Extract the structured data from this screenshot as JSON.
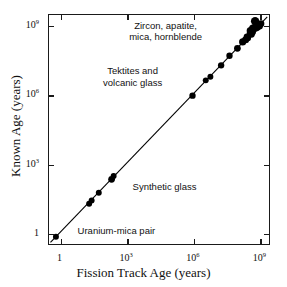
{
  "figure": {
    "background_color": "#ffffff",
    "foreground_color": "#111111"
  },
  "axes": {
    "x_title": "Fission Track Age (years)",
    "y_title": "Known Age (years)",
    "x_ticks": [
      {
        "label_mantissa": "1",
        "label_exponent": "",
        "value": 1
      },
      {
        "label_mantissa": "10",
        "label_exponent": "3",
        "value": 1000
      },
      {
        "label_mantissa": "10",
        "label_exponent": "6",
        "value": 1000000
      },
      {
        "label_mantissa": "10",
        "label_exponent": "9",
        "value": 1000000000
      }
    ],
    "y_ticks": [
      {
        "label_mantissa": "1",
        "label_exponent": "",
        "value": 1
      },
      {
        "label_mantissa": "10",
        "label_exponent": "3",
        "value": 1000
      },
      {
        "label_mantissa": "10",
        "label_exponent": "6",
        "value": 1000000
      },
      {
        "label_mantissa": "10",
        "label_exponent": "9",
        "value": 1000000000
      }
    ]
  },
  "annotations": [
    {
      "name": "zircon-apatite-label",
      "text": "Zircon, apatite,\nmica, hornblende",
      "x_pct": 53.0,
      "y_pct": 2.0,
      "align": "center"
    },
    {
      "name": "tektites-label",
      "text": "Tektites and\nvolcanic glass",
      "x_pct": 38.0,
      "y_pct": 22.0,
      "align": "center"
    },
    {
      "name": "synthetic-glass-label",
      "text": "Synthetic glass",
      "x_pct": 38.0,
      "y_pct": 72.5,
      "align": "left"
    },
    {
      "name": "uranium-mica-label",
      "text": "Uranium-mica pair",
      "x_pct": 13.0,
      "y_pct": 91.5,
      "align": "left"
    }
  ],
  "chart_data": {
    "type": "scatter",
    "title": "",
    "xlabel": "Fission Track Age (years)",
    "ylabel": "Known Age (years)",
    "xscale": "log",
    "yscale": "log",
    "xlim": [
      0.3,
      3000000000
    ],
    "ylim": [
      0.3,
      3000000000
    ],
    "grid": false,
    "legend": false,
    "marker_color": "#000000",
    "line_color": "#000000",
    "reference_line": {
      "name": "one-to-one-line",
      "description": "1:1 line, known age equals fission track age",
      "slope": 1,
      "intercept": 0,
      "x_start": 0.35,
      "x_end": 2500000000
    },
    "groups": [
      {
        "name": "Uranium-mica pair",
        "points": [
          {
            "x": 0.62,
            "y": 0.62,
            "r": 3.0
          }
        ]
      },
      {
        "name": "Synthetic glass",
        "points": [
          {
            "x": 20.0,
            "y": 17.0,
            "r": 3.0
          },
          {
            "x": 26.0,
            "y": 24.0,
            "r": 3.0
          },
          {
            "x": 55.0,
            "y": 52.0,
            "r": 3.0
          },
          {
            "x": 210.0,
            "y": 200.0,
            "r": 3.4
          },
          {
            "x": 260.0,
            "y": 280.0,
            "r": 3.0
          }
        ]
      },
      {
        "name": "Tektites and volcanic glass",
        "points": [
          {
            "x": 1000000.0,
            "y": 900000.0,
            "r": 3.2
          },
          {
            "x": 4000000.0,
            "y": 4200000.0,
            "r": 3.0
          },
          {
            "x": 6500000.0,
            "y": 6000000.0,
            "r": 3.0
          },
          {
            "x": 20000000.0,
            "y": 19000000.0,
            "r": 3.2
          },
          {
            "x": 48000000.0,
            "y": 50000000.0,
            "r": 3.2
          },
          {
            "x": 110000000.0,
            "y": 105000000.0,
            "r": 3.4
          }
        ]
      },
      {
        "name": "Zircon, apatite, mica, hornblende",
        "points": [
          {
            "x": 190000000.0,
            "y": 200000000.0,
            "r": 3.6
          },
          {
            "x": 260000000.0,
            "y": 250000000.0,
            "r": 3.6
          },
          {
            "x": 300000000.0,
            "y": 330000000.0,
            "r": 3.4
          },
          {
            "x": 330000000.0,
            "y": 300000000.0,
            "r": 3.2
          },
          {
            "x": 420000000.0,
            "y": 450000000.0,
            "r": 3.6
          },
          {
            "x": 430000000.0,
            "y": 620000000.0,
            "r": 3.8
          },
          {
            "x": 480000000.0,
            "y": 430000000.0,
            "r": 3.4
          },
          {
            "x": 520000000.0,
            "y": 560000000.0,
            "r": 3.8
          },
          {
            "x": 560000000.0,
            "y": 780000000.0,
            "r": 4.0
          },
          {
            "x": 600000000.0,
            "y": 700000000.0,
            "r": 3.4
          },
          {
            "x": 700000000.0,
            "y": 1600000000.0,
            "r": 4.2
          },
          {
            "x": 760000000.0,
            "y": 820000000.0,
            "r": 3.6
          },
          {
            "x": 900000000.0,
            "y": 880000000.0,
            "r": 3.4
          },
          {
            "x": 1100000000.0,
            "y": 1000000000.0,
            "r": 3.6
          },
          {
            "x": 1300000000.0,
            "y": 1250000000.0,
            "r": 3.4
          }
        ]
      }
    ]
  }
}
